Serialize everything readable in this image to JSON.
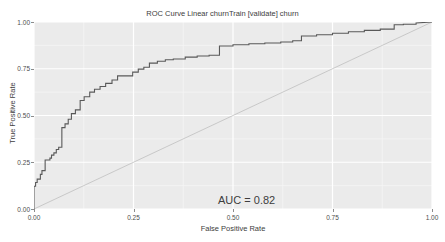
{
  "header": {
    "clipped_top_text": "·························"
  },
  "annotations": {
    "auc_label": "AUC = 0.82"
  },
  "chart_data": {
    "type": "line",
    "title": "ROC Curve Linear churnTrain [validate] churn",
    "xlabel": "False Positive Rate",
    "ylabel": "True Positive Rate",
    "xlim": [
      0,
      1
    ],
    "ylim": [
      0,
      1
    ],
    "grid": true,
    "legend": null,
    "xticks": [
      0.0,
      0.25,
      0.5,
      0.75,
      1.0
    ],
    "xticklabels": [
      "0.00",
      "0.25",
      "0.50",
      "0.75",
      "1.00"
    ],
    "yticks": [
      0.0,
      0.25,
      0.5,
      0.75,
      1.0
    ],
    "yticklabels": [
      "0.00",
      "0.25",
      "0.50",
      "0.75",
      "1.00"
    ],
    "auc": 0.82,
    "series": [
      {
        "name": "ROC curve",
        "color": "#595959",
        "style": "step",
        "x": [
          0.0,
          0.0,
          0.004,
          0.004,
          0.008,
          0.008,
          0.016,
          0.016,
          0.02,
          0.02,
          0.028,
          0.028,
          0.04,
          0.04,
          0.044,
          0.044,
          0.05,
          0.05,
          0.056,
          0.056,
          0.062,
          0.062,
          0.07,
          0.07,
          0.078,
          0.078,
          0.086,
          0.086,
          0.094,
          0.094,
          0.104,
          0.104,
          0.116,
          0.116,
          0.126,
          0.126,
          0.14,
          0.14,
          0.152,
          0.152,
          0.166,
          0.166,
          0.18,
          0.18,
          0.196,
          0.196,
          0.21,
          0.21,
          0.248,
          0.248,
          0.262,
          0.262,
          0.276,
          0.276,
          0.29,
          0.29,
          0.31,
          0.31,
          0.33,
          0.33,
          0.35,
          0.35,
          0.38,
          0.38,
          0.41,
          0.41,
          0.44,
          0.44,
          0.466,
          0.466,
          0.5,
          0.5,
          0.54,
          0.54,
          0.58,
          0.58,
          0.62,
          0.62,
          0.65,
          0.65,
          0.672,
          0.672,
          0.71,
          0.71,
          0.75,
          0.75,
          0.79,
          0.79,
          0.83,
          0.83,
          0.87,
          0.87,
          0.905,
          0.905,
          0.928,
          0.928,
          0.96,
          0.96,
          1.0
        ],
        "y": [
          0.0,
          0.122,
          0.122,
          0.142,
          0.142,
          0.16,
          0.16,
          0.185,
          0.185,
          0.205,
          0.205,
          0.262,
          0.262,
          0.272,
          0.272,
          0.288,
          0.288,
          0.3,
          0.3,
          0.318,
          0.318,
          0.33,
          0.33,
          0.435,
          0.435,
          0.455,
          0.455,
          0.48,
          0.48,
          0.51,
          0.51,
          0.53,
          0.53,
          0.58,
          0.58,
          0.6,
          0.6,
          0.625,
          0.625,
          0.64,
          0.64,
          0.655,
          0.655,
          0.672,
          0.672,
          0.69,
          0.69,
          0.712,
          0.712,
          0.732,
          0.732,
          0.748,
          0.748,
          0.758,
          0.758,
          0.78,
          0.78,
          0.79,
          0.79,
          0.798,
          0.798,
          0.802,
          0.802,
          0.812,
          0.812,
          0.818,
          0.818,
          0.822,
          0.822,
          0.872,
          0.872,
          0.878,
          0.878,
          0.884,
          0.884,
          0.888,
          0.888,
          0.893,
          0.893,
          0.9,
          0.9,
          0.925,
          0.925,
          0.932,
          0.932,
          0.94,
          0.94,
          0.948,
          0.948,
          0.955,
          0.955,
          0.962,
          0.962,
          0.985,
          0.985,
          0.988,
          0.988,
          0.995,
          1.0
        ]
      },
      {
        "name": "chance diagonal",
        "color": "#bfbfbf",
        "style": "line",
        "x": [
          0.0,
          1.0
        ],
        "y": [
          0.0,
          1.0
        ]
      }
    ]
  }
}
